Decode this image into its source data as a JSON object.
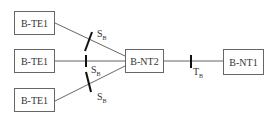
{
  "diagram": {
    "nodes": [
      {
        "id": "te1_top",
        "label": "B-TE1"
      },
      {
        "id": "te1_mid",
        "label": "B-TE1"
      },
      {
        "id": "te1_bot",
        "label": "B-TE1"
      },
      {
        "id": "nt2",
        "label": "B-NT2"
      },
      {
        "id": "nt1",
        "label": "B-NT1"
      }
    ],
    "reference_points": [
      {
        "main": "S",
        "sub": "B"
      },
      {
        "main": "S",
        "sub": "B"
      },
      {
        "main": "S",
        "sub": "B"
      },
      {
        "main": "T",
        "sub": "B"
      }
    ],
    "edges": [
      {
        "from": "te1_top",
        "to": "nt2",
        "via": "S_B"
      },
      {
        "from": "te1_mid",
        "to": "nt2",
        "via": "S_B"
      },
      {
        "from": "te1_bot",
        "to": "nt2",
        "via": "S_B"
      },
      {
        "from": "nt2",
        "to": "nt1",
        "via": "T_B"
      }
    ]
  }
}
